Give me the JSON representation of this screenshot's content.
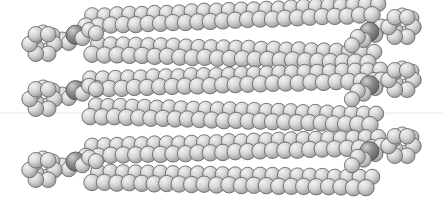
{
  "figure": {
    "subtitle": "Grayscale CPK rendering of a layered alkyl-chain assembly",
    "background_color": "#ffffff",
    "width": 443,
    "height": 208
  },
  "render": {
    "style": "space-filling (CPK) spheres",
    "palette": "grayscale",
    "atom_light_fill": "#d8d8d8",
    "atom_highlight": "#f2f2f2",
    "atom_shadow": "#9a9a9a",
    "atom_outline": "#6a6a6a",
    "heteroatom_fill": "#8e8e8e",
    "heteroatom_outline": "#555555",
    "guide_line_color": "#e9e9e9",
    "guide_line_y": 113
  },
  "structure": {
    "layer_count": 3,
    "bands_per_layer": 2,
    "total_chain_bands": 6,
    "terminal_clusters_left": 3,
    "terminal_clusters_right": 3,
    "cluster_description": "ring cage of spheres at each chain terminus",
    "linker_description": "short linker containing one darker, larger heteroatom sphere"
  },
  "chart_data": {
    "type": "scatter",
    "xlabel": "",
    "ylabel": "",
    "xlim": [
      0,
      443
    ],
    "ylim": [
      0,
      208
    ],
    "grid": false,
    "legend": "none",
    "annotations": [
      "3 stacked molecular layers",
      "6 horizontal chain bands",
      "terminal ring clusters at both ends",
      "faint horizontal guide line near vertical center"
    ],
    "series": [
      {
        "name": "layer-1-band-a",
        "kind": "chain-band",
        "y_center": 22,
        "x_start": 86,
        "x_end": 372,
        "tilt": -4,
        "rows": 2,
        "sphere_count": 48,
        "sphere_radius": 8.2
      },
      {
        "name": "layer-1-band-b",
        "kind": "chain-band",
        "y_center": 50,
        "x_start": 92,
        "x_end": 368,
        "tilt": 3,
        "rows": 2,
        "sphere_count": 46,
        "sphere_radius": 8.2
      },
      {
        "name": "layer-2-band-a",
        "kind": "chain-band",
        "y_center": 85,
        "x_start": 84,
        "x_end": 374,
        "tilt": -3,
        "rows": 2,
        "sphere_count": 48,
        "sphere_radius": 8.2
      },
      {
        "name": "layer-2-band-b",
        "kind": "chain-band",
        "y_center": 112,
        "x_start": 90,
        "x_end": 370,
        "tilt": 3,
        "rows": 2,
        "sphere_count": 47,
        "sphere_radius": 8.2
      },
      {
        "name": "layer-3-band-a",
        "kind": "chain-band",
        "y_center": 152,
        "x_start": 86,
        "x_end": 372,
        "tilt": -3,
        "rows": 2,
        "sphere_count": 48,
        "sphere_radius": 8.2
      },
      {
        "name": "layer-3-band-b",
        "kind": "chain-band",
        "y_center": 178,
        "x_start": 92,
        "x_end": 366,
        "tilt": 2,
        "rows": 2,
        "sphere_count": 46,
        "sphere_radius": 8.2
      },
      {
        "name": "cluster-left-1",
        "kind": "ring-cluster",
        "cx": 42,
        "cy": 44,
        "radius": 20,
        "sphere_count": 12
      },
      {
        "name": "cluster-left-2",
        "kind": "ring-cluster",
        "cx": 42,
        "cy": 99,
        "radius": 20,
        "sphere_count": 12
      },
      {
        "name": "cluster-left-3",
        "kind": "ring-cluster",
        "cx": 42,
        "cy": 170,
        "radius": 20,
        "sphere_count": 12
      },
      {
        "name": "cluster-right-1",
        "cx": 401,
        "cy": 27,
        "kind": "ring-cluster",
        "radius": 20,
        "sphere_count": 12
      },
      {
        "name": "cluster-right-2",
        "cx": 401,
        "cy": 80,
        "kind": "ring-cluster",
        "radius": 20,
        "sphere_count": 12
      },
      {
        "name": "cluster-right-3",
        "cx": 401,
        "cy": 146,
        "kind": "ring-cluster",
        "radius": 20,
        "sphere_count": 12
      },
      {
        "name": "linker-left-1",
        "kind": "linker",
        "x_start": 62,
        "y_start": 42,
        "x_end": 96,
        "y_end": 30,
        "heteroatom_at": 0.35
      },
      {
        "name": "linker-left-2",
        "kind": "linker",
        "x_start": 62,
        "y_start": 97,
        "x_end": 96,
        "y_end": 86,
        "heteroatom_at": 0.35
      },
      {
        "name": "linker-left-3",
        "kind": "linker",
        "x_start": 62,
        "y_start": 168,
        "x_end": 96,
        "y_end": 158,
        "heteroatom_at": 0.35
      },
      {
        "name": "linker-right-1",
        "kind": "linker",
        "x_start": 381,
        "y_start": 29,
        "x_end": 352,
        "y_end": 42,
        "heteroatom_at": 0.35
      },
      {
        "name": "linker-right-2",
        "kind": "linker",
        "x_start": 381,
        "y_start": 82,
        "x_end": 352,
        "y_end": 96,
        "heteroatom_at": 0.35
      },
      {
        "name": "linker-right-3",
        "kind": "linker",
        "x_start": 381,
        "y_start": 148,
        "x_end": 352,
        "y_end": 162,
        "heteroatom_at": 0.35
      }
    ]
  }
}
